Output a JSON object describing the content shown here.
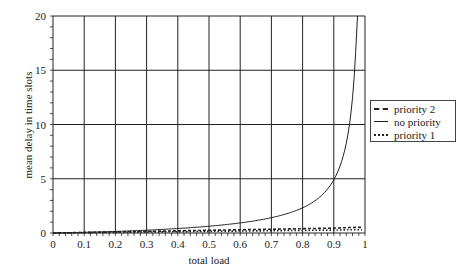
{
  "chart_data": {
    "type": "line",
    "title": "",
    "xlabel": "total load",
    "ylabel": "mean delay in time slots",
    "xlim": [
      0,
      1
    ],
    "ylim": [
      0,
      20
    ],
    "x_ticks": [
      "0",
      "0.1",
      "0.2",
      "0.3",
      "0.4",
      "0.5",
      "0.6",
      "0.7",
      "0.8",
      "0.9",
      "1"
    ],
    "y_ticks": [
      "0",
      "5",
      "10",
      "15",
      "20"
    ],
    "grid": true,
    "legend_position": "right",
    "x": [
      0,
      0.1,
      0.2,
      0.3,
      0.4,
      0.5,
      0.6,
      0.7,
      0.8,
      0.9,
      0.95,
      0.97,
      0.975
    ],
    "series": [
      {
        "name": "priority 2",
        "style": "dashed",
        "values": [
          0.0,
          0.05,
          0.1,
          0.15,
          0.2,
          0.25,
          0.3,
          0.35,
          0.4,
          0.45,
          0.5,
          0.52,
          0.52
        ]
      },
      {
        "name": "no priority",
        "style": "solid",
        "values": [
          0.0,
          0.06,
          0.13,
          0.21,
          0.33,
          0.5,
          0.75,
          1.17,
          2.0,
          4.5,
          9.5,
          16.2,
          20.0
        ]
      },
      {
        "name": "priority 1",
        "style": "dotted",
        "values": [
          0.0,
          0.03,
          0.06,
          0.09,
          0.12,
          0.15,
          0.18,
          0.21,
          0.24,
          0.27,
          0.3,
          0.3,
          0.3
        ]
      }
    ]
  },
  "legend": {
    "items": [
      {
        "label": "priority 2",
        "style": "dashed"
      },
      {
        "label": "no priority",
        "style": "solid"
      },
      {
        "label": "priority 1",
        "style": "dotted"
      }
    ]
  }
}
